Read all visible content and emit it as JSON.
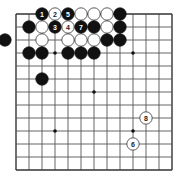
{
  "board": {
    "grid": {
      "columns": 13,
      "rows": 13,
      "origin_x": 16,
      "origin_y": 14,
      "spacing": 13,
      "line_color": "#555555",
      "edge_color": "#333333"
    },
    "star_points": [
      {
        "col": 3,
        "row": 3
      },
      {
        "col": 9,
        "row": 3
      },
      {
        "col": 6,
        "row": 6
      },
      {
        "col": 3,
        "row": 9
      },
      {
        "col": 9,
        "row": 9
      }
    ],
    "stones": [
      {
        "color": "black",
        "col": 2,
        "row": 0,
        "label": "1"
      },
      {
        "color": "white",
        "col": 3,
        "row": 0,
        "label": "2"
      },
      {
        "color": "black",
        "col": 4,
        "row": 0,
        "label": "5"
      },
      {
        "color": "white",
        "col": 5,
        "row": 0,
        "label": ""
      },
      {
        "color": "white",
        "col": 6,
        "row": 0,
        "label": ""
      },
      {
        "color": "white",
        "col": 7,
        "row": 0,
        "label": ""
      },
      {
        "color": "black",
        "col": 8,
        "row": 0,
        "label": ""
      },
      {
        "color": "black",
        "col": 1,
        "row": 1,
        "label": ""
      },
      {
        "color": "white",
        "col": 2,
        "row": 1,
        "label": ""
      },
      {
        "color": "black",
        "col": 3,
        "row": 1,
        "label": "3"
      },
      {
        "color": "white",
        "col": 4,
        "row": 1,
        "label": "4"
      },
      {
        "color": "black",
        "col": 5,
        "row": 1,
        "label": "7"
      },
      {
        "color": "black",
        "col": 6,
        "row": 1,
        "label": ""
      },
      {
        "color": "white",
        "col": 7,
        "row": 1,
        "label": ""
      },
      {
        "color": "black",
        "col": 8,
        "row": 1,
        "label": ""
      },
      {
        "color": "black",
        "col": -0.85,
        "row": 2,
        "label": ""
      },
      {
        "color": "white",
        "col": 2,
        "row": 2,
        "label": ""
      },
      {
        "color": "white",
        "col": 4,
        "row": 2,
        "label": ""
      },
      {
        "color": "white",
        "col": 5,
        "row": 2,
        "label": ""
      },
      {
        "color": "white",
        "col": 6,
        "row": 2,
        "label": ""
      },
      {
        "color": "black",
        "col": 7,
        "row": 2,
        "label": ""
      },
      {
        "color": "black",
        "col": 8,
        "row": 2,
        "label": ""
      },
      {
        "color": "black",
        "col": 1,
        "row": 3,
        "label": ""
      },
      {
        "color": "black",
        "col": 2,
        "row": 3,
        "label": ""
      },
      {
        "color": "black",
        "col": 4,
        "row": 3,
        "label": ""
      },
      {
        "color": "black",
        "col": 5,
        "row": 3,
        "label": ""
      },
      {
        "color": "black",
        "col": 6,
        "row": 3,
        "label": ""
      },
      {
        "color": "black",
        "col": 2,
        "row": 5,
        "label": ""
      },
      {
        "color": "white",
        "col": 10,
        "row": 8,
        "label": "8"
      },
      {
        "color": "white",
        "col": 9,
        "row": 10,
        "label": "6"
      }
    ],
    "colors": {
      "black_stone": "#111111",
      "white_stone": "#ffffff",
      "white_stone_border": "#333333",
      "label_on_black": "#ffffff",
      "label_on_white": "#222222"
    }
  }
}
